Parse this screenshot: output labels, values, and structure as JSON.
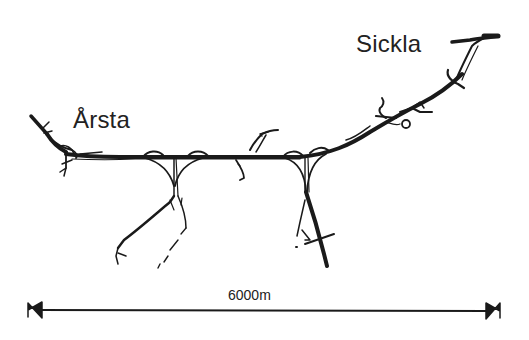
{
  "map": {
    "places": [
      {
        "name": "Årsta",
        "role": "western-end"
      },
      {
        "name": "Sickla",
        "role": "eastern-end"
      }
    ],
    "scale_bar": {
      "label": "6000m",
      "length_m": 6000,
      "arrow_style": "double-headed"
    },
    "colors": {
      "background": "#ffffff",
      "ink": "#1a1a1a"
    },
    "features": [
      {
        "type": "road-corridor",
        "description": "main east-west route from Årsta to Sickla"
      },
      {
        "type": "interchange",
        "description": "Årsta junction (west)"
      },
      {
        "type": "interchange",
        "description": "junction with southwest branch"
      },
      {
        "type": "interchange",
        "description": "central small ramp junction"
      },
      {
        "type": "interchange",
        "description": "junction with southern branch"
      },
      {
        "type": "interchange",
        "description": "eastern junction along curve"
      },
      {
        "type": "interchange",
        "description": "Sickla junction (northeast)"
      },
      {
        "type": "branch-road",
        "description": "southwest branch with dashed planned section"
      },
      {
        "type": "branch-road",
        "description": "southern branch"
      }
    ]
  }
}
